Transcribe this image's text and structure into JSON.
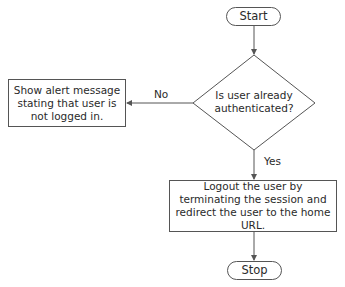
{
  "diagram": {
    "type": "flowchart",
    "nodes": {
      "start": {
        "label": "Start",
        "shape": "terminal"
      },
      "decision": {
        "label": "Is user already authenticated?",
        "line1": "Is user already",
        "line2": "authenticated?",
        "shape": "diamond"
      },
      "alert": {
        "label": "Show alert message stating that user is not logged in.",
        "shape": "process"
      },
      "logout": {
        "label": "Logout the user by terminating the session and redirect the user to the home URL.",
        "shape": "process"
      },
      "stop": {
        "label": "Stop",
        "shape": "terminal"
      }
    },
    "edges": [
      {
        "from": "start",
        "to": "decision",
        "label": ""
      },
      {
        "from": "decision",
        "to": "alert",
        "label": "No"
      },
      {
        "from": "decision",
        "to": "logout",
        "label": "Yes"
      },
      {
        "from": "logout",
        "to": "stop",
        "label": ""
      }
    ],
    "labels": {
      "no": "No",
      "yes": "Yes"
    },
    "colors": {
      "stroke": "#555555",
      "text": "#2a2a2a",
      "background": "#ffffff"
    }
  }
}
